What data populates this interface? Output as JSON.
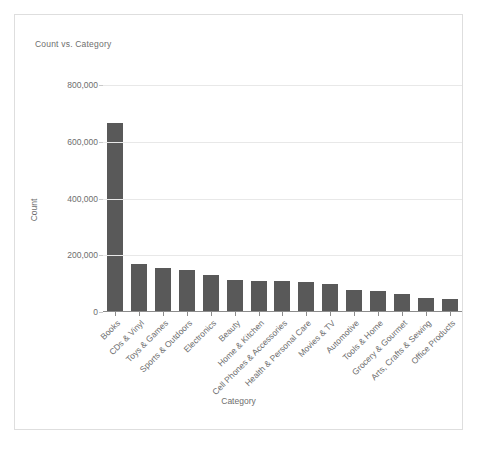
{
  "chart_data": {
    "type": "bar",
    "title": "Count vs. Category",
    "xlabel": "Category",
    "ylabel": "Count",
    "ylim": [
      0,
      800000
    ],
    "yticks": [
      "0",
      "200,000",
      "400,000",
      "600,000",
      "800,000"
    ],
    "ytick_values": [
      0,
      200000,
      400000,
      600000,
      800000
    ],
    "grid": true,
    "legend": "none",
    "bar_color": "#595959",
    "categories": [
      "Books",
      "CDs & Vinyl",
      "Toys & Games",
      "Sports & Outdoors",
      "Electronics",
      "Beauty",
      "Home & Kitchen",
      "Cell Phones & Accessories",
      "Health & Personal Care",
      "Movies & TV",
      "Automotive",
      "Tools & Home",
      "Grocery & Gourmet",
      "Arts, Crafts & Sewing",
      "Office Products"
    ],
    "values": [
      665000,
      170000,
      155000,
      148000,
      130000,
      113000,
      111000,
      108000,
      107000,
      98000,
      79000,
      75000,
      64000,
      50000,
      46000
    ]
  },
  "card": {
    "border_color": "#dedede",
    "background": "#ffffff"
  }
}
